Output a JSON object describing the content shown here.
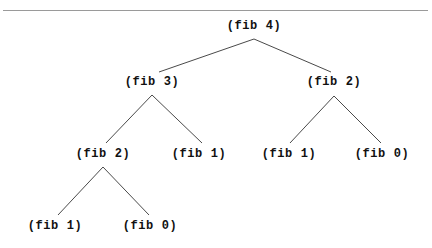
{
  "figure": {
    "width": 432,
    "height": 248,
    "background_color": "#ffffff",
    "text_color": "#111111",
    "edge_color": "#4a4a4a",
    "rule_color": "#9a9a9a"
  },
  "divider": {
    "name": "horizontal-rule",
    "x": 3,
    "y": 10,
    "width": 425,
    "thickness": 1
  },
  "tree": {
    "root_label": "(fib 4)",
    "levels": [
      {
        "depth": 0,
        "y": 26
      },
      {
        "depth": 1,
        "y": 82
      },
      {
        "depth": 2,
        "y": 154
      },
      {
        "depth": 3,
        "y": 226
      }
    ],
    "nodes": [
      {
        "id": "n0",
        "label": "(fib 4)",
        "x": 254,
        "y": 26,
        "depth": 0
      },
      {
        "id": "n00",
        "label": "(fib 3)",
        "x": 152,
        "y": 82,
        "depth": 1
      },
      {
        "id": "n01",
        "label": "(fib 2)",
        "x": 334,
        "y": 82,
        "depth": 1
      },
      {
        "id": "n000",
        "label": "(fib 2)",
        "x": 103,
        "y": 154,
        "depth": 2
      },
      {
        "id": "n001",
        "label": "(fib 1)",
        "x": 199,
        "y": 154,
        "depth": 2
      },
      {
        "id": "n010",
        "label": "(fib 1)",
        "x": 289,
        "y": 154,
        "depth": 2
      },
      {
        "id": "n011",
        "label": "(fib 0)",
        "x": 382,
        "y": 154,
        "depth": 2
      },
      {
        "id": "n0000",
        "label": "(fib 1)",
        "x": 55,
        "y": 226,
        "depth": 3
      },
      {
        "id": "n0001",
        "label": "(fib 0)",
        "x": 150,
        "y": 226,
        "depth": 3
      }
    ],
    "edges": [
      {
        "from": "n0",
        "to": "n00",
        "x1": 254,
        "y1": 39,
        "x2": 159,
        "y2": 72
      },
      {
        "from": "n0",
        "to": "n01",
        "x1": 254,
        "y1": 39,
        "x2": 331,
        "y2": 72
      },
      {
        "from": "n00",
        "to": "n000",
        "x1": 152,
        "y1": 95,
        "x2": 106,
        "y2": 143
      },
      {
        "from": "n00",
        "to": "n001",
        "x1": 152,
        "y1": 95,
        "x2": 202,
        "y2": 143
      },
      {
        "from": "n01",
        "to": "n010",
        "x1": 334,
        "y1": 96,
        "x2": 290,
        "y2": 143
      },
      {
        "from": "n01",
        "to": "n011",
        "x1": 334,
        "y1": 96,
        "x2": 381,
        "y2": 143
      },
      {
        "from": "n000",
        "to": "n0000",
        "x1": 103,
        "y1": 167,
        "x2": 58,
        "y2": 215
      },
      {
        "from": "n000",
        "to": "n0001",
        "x1": 103,
        "y1": 167,
        "x2": 149,
        "y2": 215
      }
    ]
  }
}
